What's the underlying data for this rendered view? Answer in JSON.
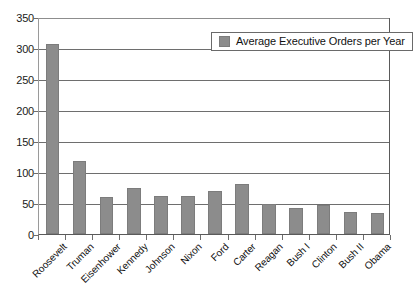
{
  "chart_data": {
    "type": "bar",
    "title": "",
    "subtitle": "",
    "xlabel": "",
    "ylabel": "",
    "ylim": [
      0,
      350
    ],
    "y_ticks": [
      0,
      50,
      100,
      150,
      200,
      250,
      300,
      350
    ],
    "grid": true,
    "legend_position": "top-right",
    "series_name": "Average Executive Orders per Year",
    "bar_color": "#8c8c8c",
    "categories": [
      "Roosevelt",
      "Truman",
      "Eisenhower",
      "Kennedy",
      "Johnson",
      "Nixon",
      "Ford",
      "Carter",
      "Reagan",
      "Bush I",
      "Clinton",
      "Bush II",
      "Obama"
    ],
    "values": [
      307,
      117,
      60,
      75,
      62,
      61,
      69,
      80,
      48,
      42,
      46,
      36,
      34
    ],
    "series": [
      {
        "name": "Average Executive Orders per Year",
        "values": [
          307,
          117,
          60,
          75,
          62,
          61,
          69,
          80,
          48,
          42,
          46,
          36,
          34
        ]
      }
    ]
  },
  "legend": {
    "label": "Average Executive Orders per Year",
    "swatch_color": "#8c8c8c"
  },
  "axes": {
    "y_tick_labels": [
      "350",
      "300",
      "250",
      "200",
      "150",
      "100",
      "50",
      "0"
    ],
    "x_tick_labels": [
      "Roosevelt",
      "Truman",
      "Eisenhower",
      "Kennedy",
      "Johnson",
      "Nixon",
      "Ford",
      "Carter",
      "Reagan",
      "Bush I",
      "Clinton",
      "Bush II",
      "Obama"
    ]
  }
}
